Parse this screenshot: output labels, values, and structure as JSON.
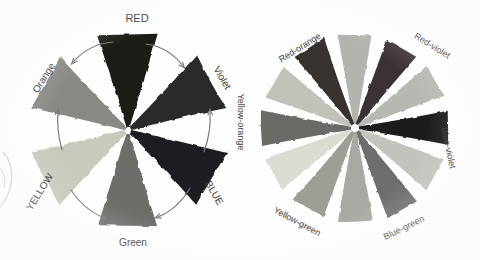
{
  "figure": {
    "background_color": "#fefefe",
    "label_color": "#3b3b3b",
    "arrow_color": "#7a7a7a"
  },
  "left_wheel": {
    "name": "primary-secondary-color-wheel",
    "center": {
      "x": 128,
      "y": 130
    },
    "segment_count": 6,
    "segments": [
      {
        "label": "RED",
        "angle_deg": 0,
        "swatch_color": "#1c1a19",
        "label_rotation_deg": 0,
        "label_x": 137,
        "label_y": 18,
        "font_size": 11,
        "letter_case": "upper"
      },
      {
        "label": "Violet",
        "angle_deg": 60,
        "swatch_color": "#2b2a2c",
        "label_rotation_deg": 60,
        "label_x": 222,
        "label_y": 78,
        "font_size": 10,
        "letter_case": "title"
      },
      {
        "label": "BLUE",
        "angle_deg": 120,
        "swatch_color": "#1f1e20",
        "label_rotation_deg": 60,
        "label_x": 214,
        "label_y": 193,
        "font_size": 10,
        "letter_case": "upper"
      },
      {
        "label": "Green",
        "angle_deg": 180,
        "swatch_color": "#6d6d6a",
        "label_rotation_deg": 0,
        "label_x": 133,
        "label_y": 243,
        "font_size": 10,
        "letter_case": "title"
      },
      {
        "label": "YELLOW",
        "angle_deg": 240,
        "swatch_color": "#c9c9bd",
        "label_rotation_deg": -58,
        "label_x": 40,
        "label_y": 192,
        "font_size": 10,
        "letter_case": "upper"
      },
      {
        "label": "Orange",
        "angle_deg": 300,
        "swatch_color": "#8a8a85",
        "label_rotation_deg": -58,
        "label_x": 44,
        "label_y": 78,
        "font_size": 10,
        "letter_case": "title"
      }
    ],
    "arrows": [
      {
        "name": "arrow-red-to-orange",
        "from": "RED",
        "to": "Orange",
        "direction": "counterclockwise"
      },
      {
        "name": "arrow-red-to-violet",
        "from": "RED",
        "to": "Violet",
        "direction": "clockwise"
      },
      {
        "name": "arrow-yellow-to-orange",
        "from": "YELLOW",
        "to": "Orange",
        "direction": "up"
      },
      {
        "name": "arrow-yellow-to-green",
        "from": "YELLOW",
        "to": "Green",
        "direction": "clockwise"
      },
      {
        "name": "arrow-blue-to-violet",
        "from": "BLUE",
        "to": "Violet",
        "direction": "up"
      },
      {
        "name": "arrow-blue-to-green",
        "from": "BLUE",
        "to": "Green",
        "direction": "counterclockwise"
      }
    ]
  },
  "right_wheel": {
    "name": "twelve-part-tertiary-color-wheel",
    "center": {
      "x": 355,
      "y": 128
    },
    "segment_count": 12,
    "segments": [
      {
        "label": "",
        "angle_deg": 0,
        "swatch_color": "#b4b4ae",
        "labeled": false
      },
      {
        "label": "Red-violet",
        "angle_deg": 30,
        "swatch_color": "#3a3338",
        "labeled": true,
        "label_rotation_deg": 32,
        "label_x": 432,
        "label_y": 46,
        "font_size": 9
      },
      {
        "label": "",
        "angle_deg": 60,
        "swatch_color": "#b9b9b3",
        "labeled": false
      },
      {
        "label": "Blue-violet",
        "angle_deg": 90,
        "swatch_color": "#1d1c1e",
        "labeled": true,
        "label_rotation_deg": 78,
        "label_x": 448,
        "label_y": 148,
        "font_size": 9
      },
      {
        "label": "",
        "angle_deg": 120,
        "swatch_color": "#c4c4be",
        "labeled": false
      },
      {
        "label": "Blue-green",
        "angle_deg": 150,
        "swatch_color": "#6e6e6c",
        "labeled": true,
        "label_rotation_deg": -26,
        "label_x": 404,
        "label_y": 228,
        "font_size": 9
      },
      {
        "label": "",
        "angle_deg": 180,
        "swatch_color": "#a9a9a3",
        "labeled": false
      },
      {
        "label": "Yellow-green",
        "angle_deg": 210,
        "swatch_color": "#9e9e96",
        "labeled": true,
        "label_rotation_deg": 28,
        "label_x": 297,
        "label_y": 222,
        "font_size": 9
      },
      {
        "label": "",
        "angle_deg": 240,
        "swatch_color": "#dcdcd2",
        "labeled": false
      },
      {
        "label": "Yellow-orange",
        "angle_deg": 270,
        "swatch_color": "#6a6a66",
        "labeled": true,
        "label_rotation_deg": 90,
        "label_x": 240,
        "label_y": 122,
        "font_size": 9
      },
      {
        "label": "",
        "angle_deg": 300,
        "swatch_color": "#c2c2ba",
        "labeled": false
      },
      {
        "label": "Red-orange",
        "angle_deg": 330,
        "swatch_color": "#37322f",
        "labeled": true,
        "label_rotation_deg": -32,
        "label_x": 300,
        "label_y": 48,
        "font_size": 9
      }
    ]
  },
  "edge_fragment": {
    "name": "cropped-adjacent-figure-fragment",
    "visible": true,
    "x": 0,
    "y": 150,
    "stroke_color": "#d2d2d2"
  }
}
